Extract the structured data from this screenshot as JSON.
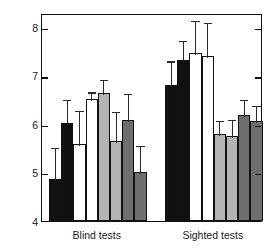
{
  "chart_data": {
    "type": "bar",
    "title": "",
    "xlabel": "",
    "ylabel": "Means of preference ratings",
    "ylim": [
      4,
      8.3
    ],
    "yticks": [
      4,
      5,
      6,
      7,
      8
    ],
    "ytick_labels": [
      "4",
      "5",
      "6",
      "7",
      "8"
    ],
    "grid": false,
    "legend": "none",
    "categories": [
      "Blind tests",
      "Sighted tests"
    ],
    "bar_colors": {
      "black": "#101010",
      "white": "#ffffff",
      "light_gray": "#b3b3b3",
      "dark_gray": "#6e6e6e"
    },
    "series": [
      {
        "name": "bar-1",
        "color_key": "black",
        "values": [
          4.87,
          6.82
        ],
        "err_upper": [
          0.68,
          0.52
        ],
        "err_lower": [
          0.0,
          0.0
        ]
      },
      {
        "name": "bar-2",
        "color_key": "black",
        "values": [
          6.02,
          7.33
        ],
        "err_upper": [
          0.52,
          0.44
        ],
        "err_lower": [
          0.0,
          0.0
        ]
      },
      {
        "name": "bar-3",
        "color_key": "white",
        "values": [
          5.6,
          7.47
        ],
        "err_upper": [
          0.72,
          0.7
        ],
        "err_lower": [
          0.0,
          0.0
        ]
      },
      {
        "name": "bar-4",
        "color_key": "white",
        "values": [
          6.52,
          7.42
        ],
        "err_upper": [
          0.18,
          0.71
        ],
        "err_lower": [
          0.0,
          0.0
        ]
      },
      {
        "name": "bar-5",
        "color_key": "light_gray",
        "values": [
          6.65,
          5.8
        ],
        "err_upper": [
          0.3,
          0.31
        ],
        "err_lower": [
          0.0,
          0.0
        ]
      },
      {
        "name": "bar-6",
        "color_key": "light_gray",
        "values": [
          5.65,
          5.75
        ],
        "err_upper": [
          0.65,
          0.38
        ],
        "err_lower": [
          0.0,
          0.0
        ]
      },
      {
        "name": "bar-7",
        "color_key": "dark_gray",
        "values": [
          6.09,
          6.2
        ],
        "err_upper": [
          0.58,
          0.35
        ],
        "err_lower": [
          0.0,
          0.0
        ]
      },
      {
        "name": "bar-8",
        "color_key": "dark_gray",
        "values": [
          5.01,
          6.07
        ],
        "err_upper": [
          0.59,
          0.35
        ],
        "err_lower": [
          0.0,
          0.0
        ]
      }
    ]
  }
}
